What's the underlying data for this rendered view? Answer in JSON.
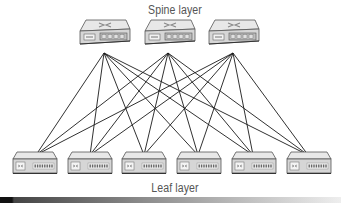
{
  "diagram": {
    "spine_label": "Spine layer",
    "leaf_label": "Leaf layer",
    "colors": {
      "line": "#1a1a1a",
      "device_top": "#e8e8e8",
      "device_front": "#d6d6d6",
      "device_stroke": "#555555",
      "label": "#555555"
    },
    "spine_switches": [
      {
        "id": "spine-1",
        "x": 80,
        "y": 20,
        "port_x": 104,
        "port_y": 53
      },
      {
        "id": "spine-2",
        "x": 145,
        "y": 20,
        "port_x": 168,
        "port_y": 53
      },
      {
        "id": "spine-3",
        "x": 209,
        "y": 20,
        "port_x": 233,
        "port_y": 53
      }
    ],
    "leaf_switches": [
      {
        "id": "leaf-1",
        "x": 13,
        "y": 152,
        "port_x": 36,
        "port_y": 155
      },
      {
        "id": "leaf-2",
        "x": 68,
        "y": 152,
        "port_x": 90,
        "port_y": 155
      },
      {
        "id": "leaf-3",
        "x": 122,
        "y": 152,
        "port_x": 144,
        "port_y": 155
      },
      {
        "id": "leaf-4",
        "x": 177,
        "y": 152,
        "port_x": 198,
        "port_y": 155
      },
      {
        "id": "leaf-5",
        "x": 232,
        "y": 152,
        "port_x": 253,
        "port_y": 155
      },
      {
        "id": "leaf-6",
        "x": 287,
        "y": 152,
        "port_x": 308,
        "port_y": 155
      }
    ],
    "connections": "full-mesh: every spine connects to every leaf"
  }
}
